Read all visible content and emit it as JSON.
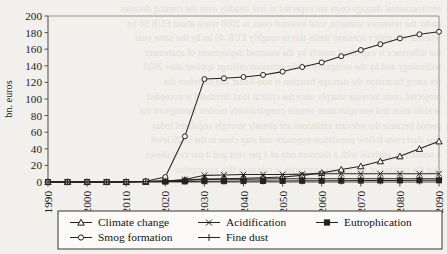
{
  "background_text": {
    "note": "faint bleed-through text from reverse of scanned page",
    "lines": [
      "environmental damage costs are expected to rise steadily over the coming decades",
      "under the reference scenario, total external costs in 2050 reach about EUR 90 bn",
      "whereas the policy scenario limits this to roughly EUR 40 bn by the same year",
      "the difference is explained mainly by the assumed deployment of abatement",
      "technology and by the stringency of the emission ceilings applied after 2030",
      "for smog formation the damage function is non-linear and therefore the",
      "projected costs increase sharply once the critical load threshold is exceeded",
      "acidification and eutrophication remain comparatively modest throughout the",
      "period because the relevant emissions are already strongly regulated today",
      "fine dust costs follow population exposure and stay close to the 2020 level",
      "a sensitivity analysis with a discount rate of 1 per cent and 4 per cent shows",
      "that the ranking of the impact categories is robust to this assumption"
    ]
  },
  "chart_data": {
    "type": "line",
    "title": "",
    "xlabel": "",
    "ylabel": "bn. euros",
    "xlim": [
      1990,
      2090
    ],
    "ylim": [
      0,
      200
    ],
    "ytick_step": 20,
    "yticks": [
      0,
      20,
      40,
      60,
      80,
      100,
      120,
      140,
      160,
      180,
      200
    ],
    "xticks_labeled": [
      1990,
      2000,
      2010,
      2020,
      2030,
      2040,
      2050,
      2060,
      2070,
      2080,
      2090
    ],
    "x": [
      1990,
      1995,
      2000,
      2005,
      2010,
      2015,
      2020,
      2025,
      2030,
      2035,
      2040,
      2045,
      2050,
      2055,
      2060,
      2065,
      2070,
      2075,
      2080,
      2085,
      2090
    ],
    "grid": false,
    "legend_position": "bottom",
    "series": [
      {
        "name": "Climate change",
        "marker": "triangle-open",
        "values": [
          0,
          0,
          0,
          0,
          0,
          0.5,
          1.5,
          2.5,
          3.5,
          4,
          4.5,
          5,
          6,
          8,
          11,
          15,
          19,
          25,
          31,
          40,
          49
        ]
      },
      {
        "name": "Acidification",
        "marker": "x",
        "values": [
          0,
          0,
          0,
          0,
          0.2,
          0.5,
          1,
          3,
          8,
          8.5,
          9,
          9,
          9,
          9.5,
          10,
          10,
          10,
          10,
          10,
          10,
          10
        ]
      },
      {
        "name": "Eutrophication",
        "marker": "square-filled",
        "values": [
          0,
          0,
          0,
          0,
          0,
          0.2,
          0.5,
          0.7,
          1,
          1,
          1.1,
          1.2,
          1.3,
          1.4,
          1.5,
          1.6,
          1.7,
          1.8,
          1.9,
          2,
          2
        ]
      },
      {
        "name": "Smog formation",
        "marker": "circle-open",
        "values": [
          0,
          0,
          0,
          0,
          0.3,
          1,
          6,
          55,
          124,
          125,
          126.5,
          129,
          133,
          138.5,
          144,
          151.5,
          159,
          166,
          173,
          178,
          181
        ]
      },
      {
        "name": "Fine dust",
        "marker": "plus",
        "values": [
          0,
          0,
          0,
          0,
          0.2,
          0.6,
          1.2,
          2,
          3,
          3.2,
          3.4,
          3.6,
          3.8,
          3.9,
          4,
          4,
          4,
          4,
          4,
          4,
          4
        ]
      }
    ]
  },
  "legend": {
    "entries": [
      {
        "label": "Climate change",
        "marker": "triangle-open"
      },
      {
        "label": "Acidification",
        "marker": "x"
      },
      {
        "label": "Eutrophication",
        "marker": "square-filled"
      },
      {
        "label": "Smog formation",
        "marker": "circle-open"
      },
      {
        "label": "Fine dust",
        "marker": "plus"
      }
    ]
  },
  "colors": {
    "line": "#25231f",
    "axis": "#56524d",
    "background": "#f2f0ec",
    "legend_border": "#4a4641"
  }
}
